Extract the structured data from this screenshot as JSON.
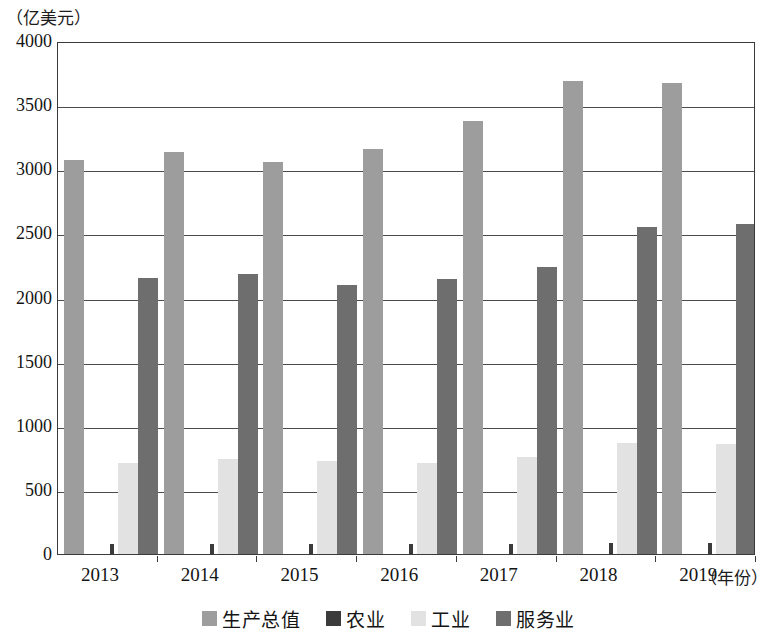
{
  "chart_data": {
    "type": "bar",
    "title": "",
    "subtitle": "",
    "ylabel": "（亿美元）",
    "xlabel": "（年份）",
    "categories": [
      "2013",
      "2014",
      "2015",
      "2016",
      "2017",
      "2018",
      "2019"
    ],
    "ylim": [
      0,
      4000
    ],
    "yticks": [
      "0",
      "500",
      "1000",
      "1500",
      "2000",
      "2500",
      "3000",
      "3500",
      "4000"
    ],
    "ytick_values": [
      0,
      500,
      1000,
      1500,
      2000,
      2500,
      3000,
      3500,
      4000
    ],
    "grid": true,
    "legend_position": "bottom",
    "series": [
      {
        "name": "生产总值",
        "color": "#9d9d9d",
        "values": [
          3070,
          3135,
          3060,
          3160,
          3380,
          3690,
          3670
        ]
      },
      {
        "name": "农业",
        "color": "#3b3b3b",
        "values": [
          75,
          80,
          78,
          76,
          80,
          85,
          85
        ]
      },
      {
        "name": "工业",
        "color": "#e2e2e2",
        "values": [
          710,
          740,
          725,
          710,
          760,
          865,
          855
        ]
      },
      {
        "name": "服务业",
        "color": "#6e6e6e",
        "values": [
          2150,
          2180,
          2100,
          2145,
          2240,
          2550,
          2570
        ]
      }
    ]
  },
  "axes": {
    "y_unit_caption": "（亿美元）",
    "x_unit_caption": "（年份）"
  },
  "colors": {
    "frame": "#3a3a3a",
    "gridline": "#4a4a4a",
    "background": "#ffffff",
    "text": "#141414"
  }
}
